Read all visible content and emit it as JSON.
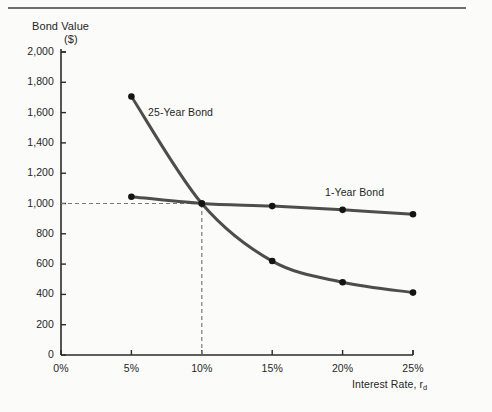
{
  "figure": {
    "background_color": "#fbfbfa",
    "rule_color": "#6e6e6e"
  },
  "chart_data": {
    "type": "line",
    "title": "",
    "ylabel_line1": "Bond Value",
    "ylabel_line2": "($)",
    "xlabel": "Interest Rate, r",
    "xlabel_subscript": "d",
    "x": [
      0,
      5,
      10,
      15,
      20,
      25
    ],
    "xtick_labels": [
      "0%",
      "5%",
      "10%",
      "15%",
      "20%",
      "25%"
    ],
    "xlim": [
      0,
      25
    ],
    "ytick_labels": [
      "0",
      "200",
      "400",
      "600",
      "800",
      "1,000",
      "1,200",
      "1,400",
      "1,600",
      "1,800",
      "2,000"
    ],
    "ytick_values": [
      0,
      200,
      400,
      600,
      800,
      1000,
      1200,
      1400,
      1600,
      1800,
      2000
    ],
    "ylim": [
      0,
      2000
    ],
    "grid": false,
    "legend_position": "inline-annotations",
    "series": [
      {
        "name": "25-Year Bond",
        "color": "#4d4d4d",
        "marker_color": "#141414",
        "x": [
          5,
          10,
          15,
          20,
          25
        ],
        "values": [
          1706,
          1000,
          620,
          480,
          412
        ]
      },
      {
        "name": "1-Year Bond",
        "color": "#4d4d4d",
        "marker_color": "#141414",
        "x": [
          5,
          10,
          15,
          20,
          25
        ],
        "values": [
          1045,
          1000,
          983,
          958,
          929
        ]
      }
    ],
    "annotations": [
      {
        "text": "25-Year Bond",
        "x": 7.2,
        "y": 1570
      },
      {
        "text": "1-Year Bond",
        "x": 18.8,
        "y": 1060
      }
    ],
    "reference_lines": [
      {
        "orientation": "horizontal",
        "value": 1000,
        "style": "dashed",
        "color": "#7a7a7a",
        "from_x": 0,
        "to_x": 10
      },
      {
        "orientation": "vertical",
        "value": 10,
        "style": "dashed",
        "color": "#7a7a7a",
        "from_y": 0,
        "to_y": 1000
      }
    ]
  }
}
